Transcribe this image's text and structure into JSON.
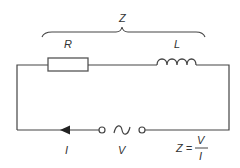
{
  "diagram": {
    "type": "series RL circuit",
    "labels": {
      "impedance": "Z",
      "resistor": "R",
      "inductor": "L",
      "current": "I",
      "voltage": "V",
      "formula_lhs": "Z =",
      "formula_num": "V",
      "formula_den": "I"
    },
    "colors": {
      "line": "#444444",
      "text": "#333333",
      "background": "#ffffff"
    },
    "components": [
      {
        "name": "resistor",
        "symbol": "rectangle",
        "label": "R"
      },
      {
        "name": "inductor",
        "symbol": "coil",
        "label": "L"
      },
      {
        "name": "ac-source",
        "symbol": "tilde-between-terminals",
        "label": "V"
      },
      {
        "name": "current-arrow",
        "symbol": "arrowhead",
        "label": "I"
      }
    ]
  }
}
